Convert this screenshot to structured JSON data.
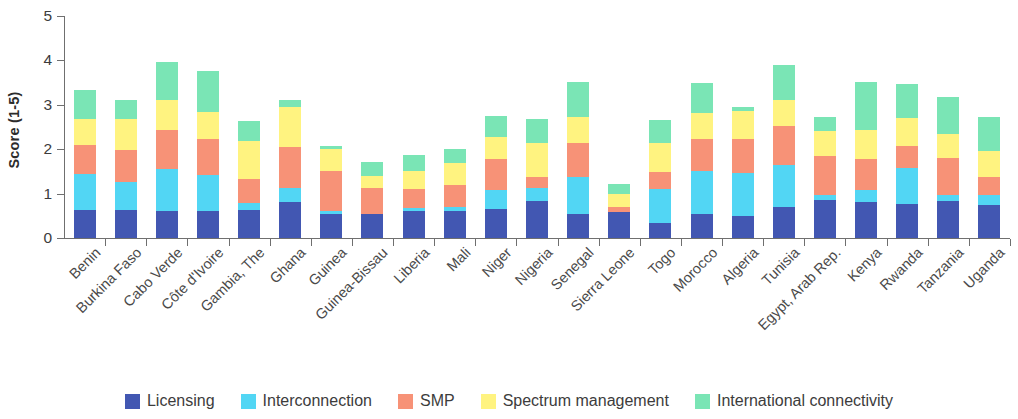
{
  "chart_data": {
    "type": "bar",
    "stacked": true,
    "title": "",
    "subtitle": "",
    "xlabel": "",
    "ylabel": "Score (1-5)",
    "ylim": [
      0,
      5
    ],
    "yticks": [
      0,
      1,
      2,
      3,
      4,
      5
    ],
    "grid": false,
    "legend_position": "bottom",
    "categories": [
      "Benin",
      "Burkina Faso",
      "Cabo Verde",
      "Côte d'Ivoire",
      "Gambia, The",
      "Ghana",
      "Guinea",
      "Guinea-Bissau",
      "Liberia",
      "Mali",
      "Niger",
      "Nigeria",
      "Senegal",
      "Sierra Leone",
      "Togo",
      "Morocco",
      "Algeria",
      "Tunisia",
      "Egypt, Arab Rep.",
      "Kenya",
      "Rwanda",
      "Tanzania",
      "Uganda"
    ],
    "series": [
      {
        "name": "Licensing",
        "color": "#4257b2",
        "values": [
          0.62,
          0.62,
          0.6,
          0.6,
          0.62,
          0.82,
          0.55,
          0.54,
          0.6,
          0.6,
          0.66,
          0.84,
          0.55,
          0.58,
          0.33,
          0.54,
          0.5,
          0.7,
          0.86,
          0.82,
          0.76,
          0.84,
          0.74
        ]
      },
      {
        "name": "Interconnection",
        "color": "#52d6f4",
        "values": [
          0.82,
          0.65,
          0.96,
          0.82,
          0.18,
          0.3,
          0.06,
          0.0,
          0.08,
          0.1,
          0.42,
          0.28,
          0.82,
          0.0,
          0.78,
          0.98,
          0.96,
          0.94,
          0.1,
          0.26,
          0.82,
          0.12,
          0.22
        ]
      },
      {
        "name": "SMP",
        "color": "#f79277",
        "values": [
          0.66,
          0.72,
          0.88,
          0.8,
          0.52,
          0.94,
          0.9,
          0.58,
          0.42,
          0.5,
          0.7,
          0.26,
          0.78,
          0.12,
          0.38,
          0.7,
          0.76,
          0.88,
          0.88,
          0.7,
          0.5,
          0.84,
          0.42
        ]
      },
      {
        "name": "Spectrum management",
        "color": "#fff380",
        "values": [
          0.58,
          0.7,
          0.68,
          0.62,
          0.86,
          0.9,
          0.5,
          0.28,
          0.42,
          0.48,
          0.5,
          0.76,
          0.58,
          0.3,
          0.66,
          0.6,
          0.64,
          0.6,
          0.58,
          0.66,
          0.62,
          0.54,
          0.58
        ]
      },
      {
        "name": "International connectivity",
        "color": "#7ae5b5",
        "values": [
          0.65,
          0.42,
          0.84,
          0.92,
          0.46,
          0.16,
          0.07,
          0.32,
          0.36,
          0.32,
          0.46,
          0.54,
          0.78,
          0.22,
          0.5,
          0.68,
          0.1,
          0.78,
          0.3,
          1.08,
          0.78,
          0.84,
          0.76
        ]
      }
    ],
    "totals": [
      3.33,
      3.11,
      3.96,
      3.76,
      2.64,
      3.12,
      2.08,
      1.72,
      1.88,
      2.0,
      2.74,
      2.68,
      3.51,
      1.22,
      2.65,
      3.5,
      2.96,
      3.9,
      2.72,
      3.52,
      3.48,
      3.18,
      2.72
    ]
  },
  "legend": {
    "items": [
      {
        "label": "Licensing",
        "color": "#4257b2"
      },
      {
        "label": "Interconnection",
        "color": "#52d6f4"
      },
      {
        "label": "SMP",
        "color": "#f79277"
      },
      {
        "label": "Spectrum management",
        "color": "#fff380"
      },
      {
        "label": "International connectivity",
        "color": "#7ae5b5"
      }
    ]
  }
}
